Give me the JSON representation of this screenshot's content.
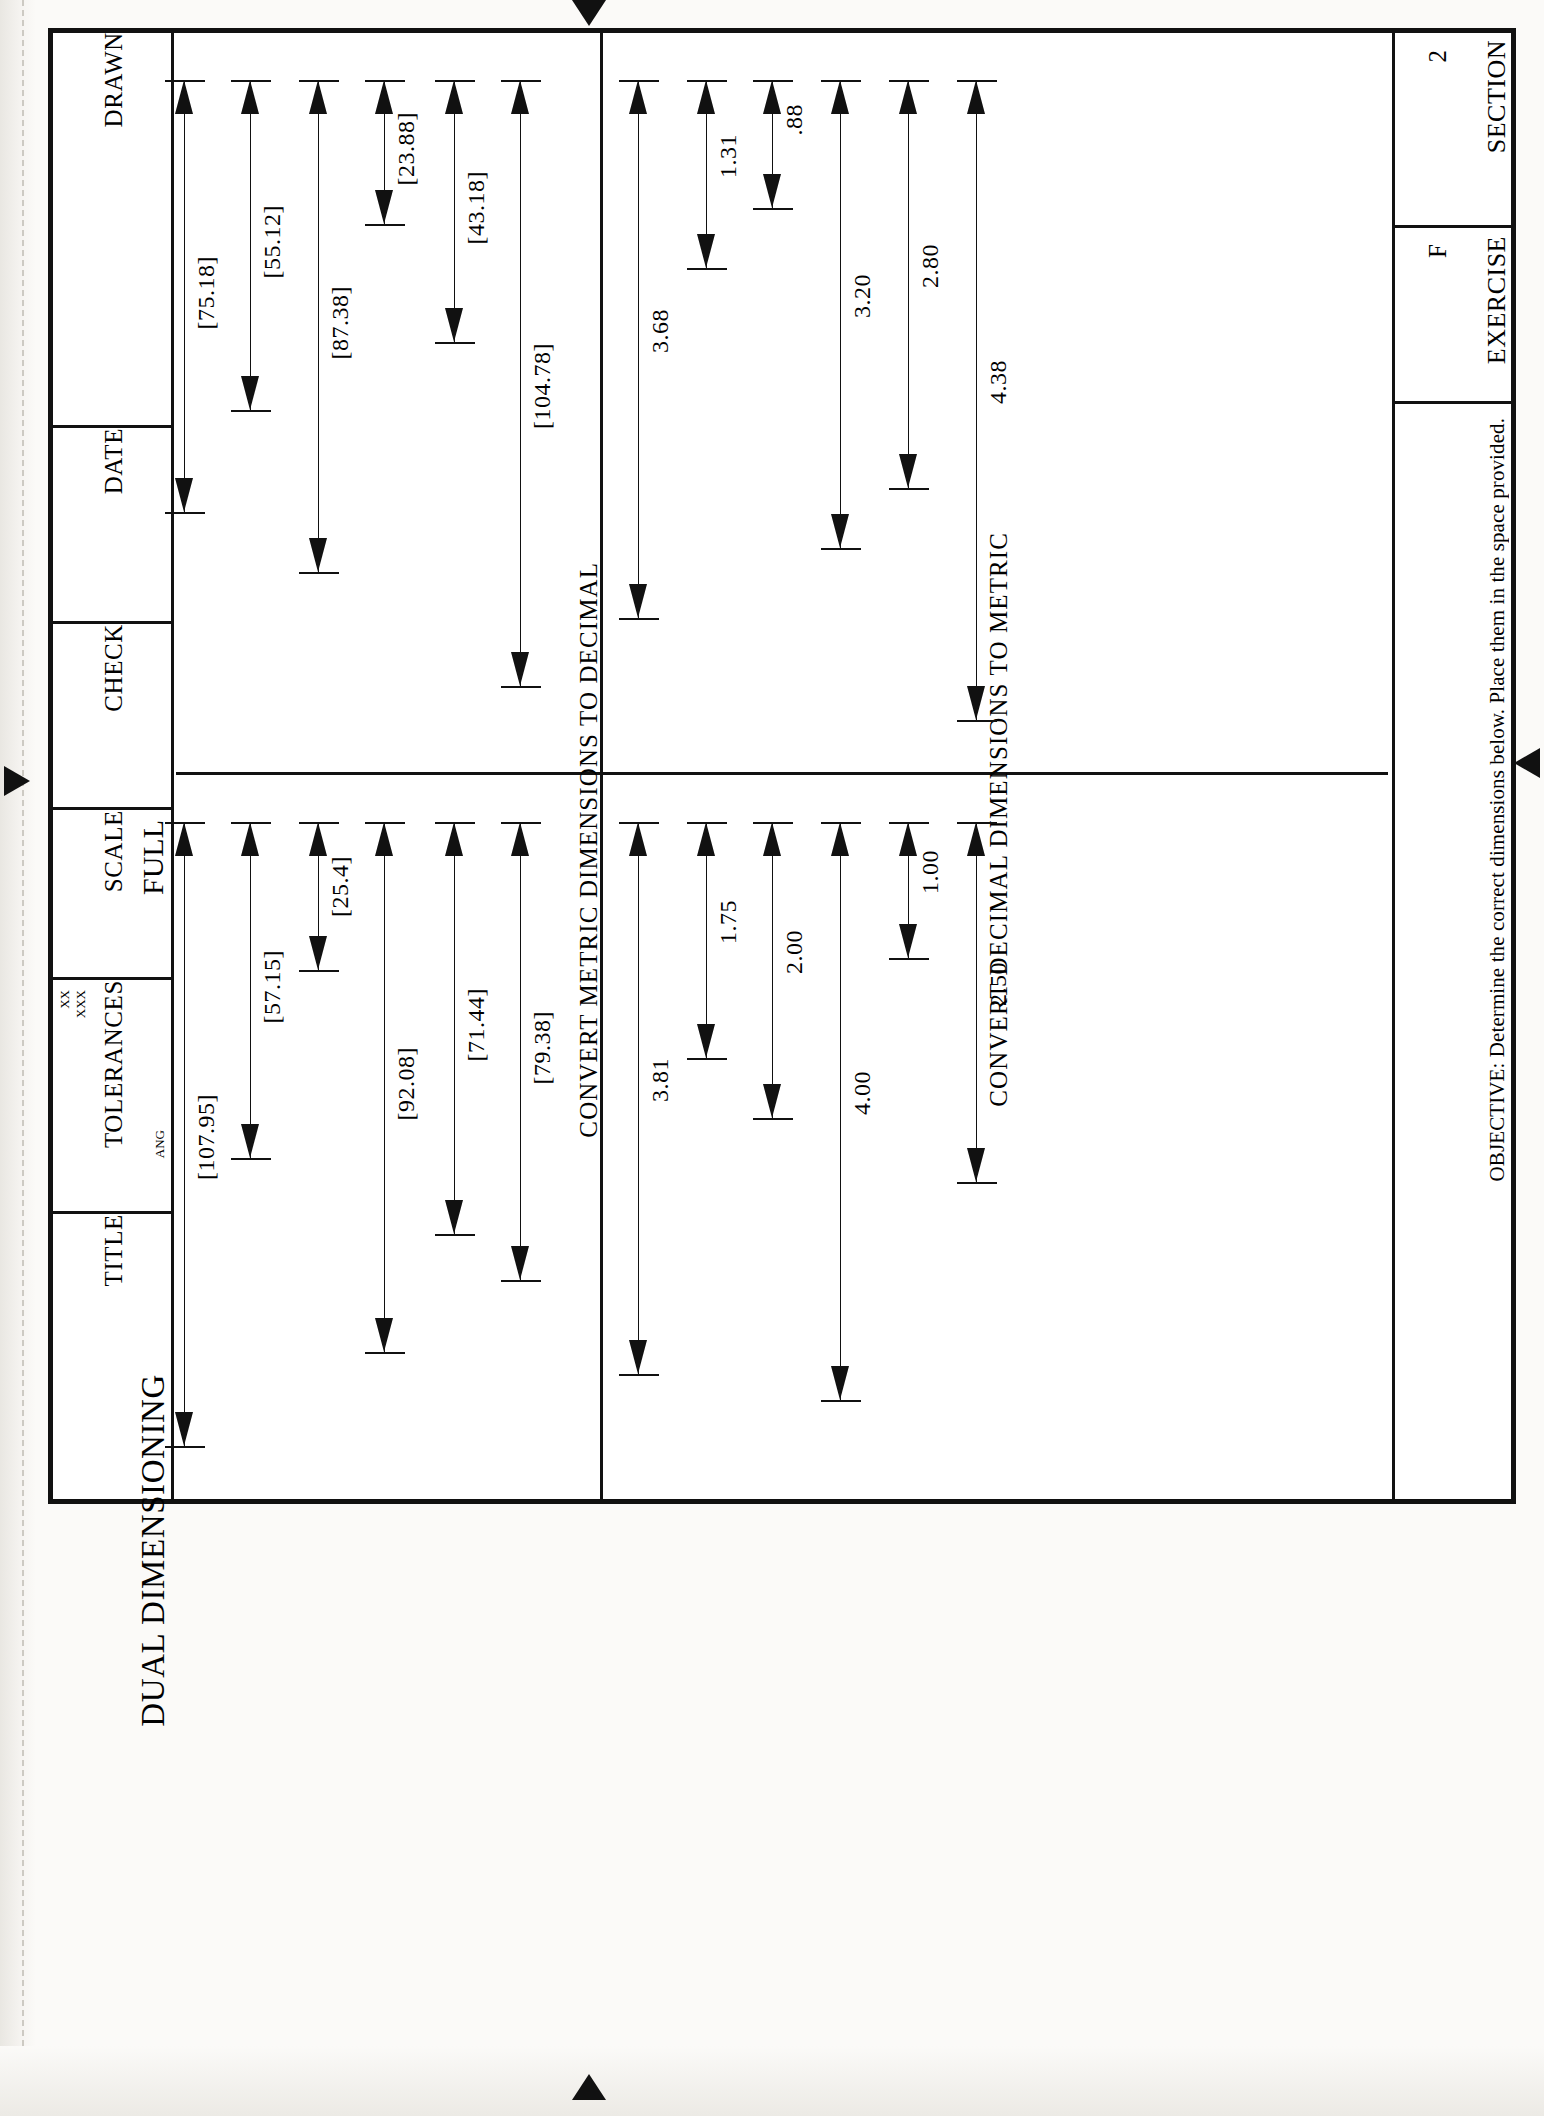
{
  "sheet": {
    "title_block": {
      "fields": [
        {
          "label": "DRAWN",
          "value": ""
        },
        {
          "label": "DATE",
          "value": ""
        },
        {
          "label": "CHECK",
          "value": ""
        },
        {
          "label": "SCALE",
          "value": "FULL"
        },
        {
          "label": "TOLERANCES",
          "value": "",
          "tol_xx": "XX",
          "tol_xxx": "XXX",
          "tol_ang": "ANG"
        },
        {
          "label": "TITLE",
          "value": "DUAL DIMENSIONING"
        }
      ]
    },
    "header": {
      "section_label": "SECTION",
      "section_value": "2",
      "exercise_label": "EXERCISE",
      "exercise_value": "F",
      "objective": "OBJECTIVE: Determine the correct dimensions below. Place them in the space provided."
    },
    "headings": {
      "decimal_to_metric": "CONVERT DECIMAL DIMENSIONS TO METRIC",
      "metric_to_decimal": "CONVERT METRIC DIMENSIONS TO DECIMAL"
    }
  },
  "chart_data": {
    "type": "table",
    "title": "DUAL DIMENSIONING",
    "xlabel": "",
    "ylabel": "",
    "quadrants": [
      {
        "name": "decimal-to-metric-given",
        "heading": "CONVERT DECIMAL DIMENSIONS TO METRIC",
        "units": "inch",
        "dimensions": [
          {
            "label": ".88",
            "value": 0.88
          },
          {
            "label": "1.31",
            "value": 1.31
          },
          {
            "label": "3.68",
            "value": 3.68
          },
          {
            "label": "3.20",
            "value": 3.2
          },
          {
            "label": "2.80",
            "value": 2.8
          },
          {
            "label": "4.38",
            "value": 4.38
          }
        ]
      },
      {
        "name": "decimal-to-metric-answers",
        "heading": "",
        "units": "mm",
        "dimensions": [
          {
            "label": "[23.88]",
            "value": 23.88
          },
          {
            "label": "[43.18]",
            "value": 43.18
          },
          {
            "label": "[104.78]",
            "value": 104.78
          },
          {
            "label": "[87.38]",
            "value": 87.38
          },
          {
            "label": "[55.12]",
            "value": 55.12
          },
          {
            "label": "[75.18]",
            "value": 75.18
          }
        ]
      },
      {
        "name": "metric-to-decimal-given",
        "heading": "CONVERT METRIC DIMENSIONS TO DECIMAL",
        "units": "inch",
        "dimensions": [
          {
            "label": "1.00",
            "value": 1.0
          },
          {
            "label": "2.00",
            "value": 2.0
          },
          {
            "label": "1.75",
            "value": 1.75
          },
          {
            "label": "3.81",
            "value": 3.81
          },
          {
            "label": "4.00",
            "value": 4.0
          },
          {
            "label": "2.50",
            "value": 2.5
          }
        ]
      },
      {
        "name": "metric-to-decimal-answers",
        "heading": "",
        "units": "mm",
        "dimensions": [
          {
            "label": "[25.4]",
            "value": 25.4
          },
          {
            "label": "[57.15]",
            "value": 57.15
          },
          {
            "label": "[92.08]",
            "value": 92.08
          },
          {
            "label": "[71.44]",
            "value": 71.44
          },
          {
            "label": "[79.38]",
            "value": 79.38
          },
          {
            "label": "[107.95]",
            "value": 107.95
          }
        ]
      }
    ]
  },
  "dims": {
    "q1": [
      {
        "label": "[75.18]",
        "x": 8,
        "y": 48,
        "len": 432
      },
      {
        "label": "[55.12]",
        "x": 74,
        "y": 48,
        "len": 330
      },
      {
        "label": "[87.38]",
        "x": 142,
        "y": 48,
        "len": 492
      },
      {
        "label": "[23.88]",
        "x": 208,
        "y": 48,
        "len": 144
      },
      {
        "label": "[43.18]",
        "x": 278,
        "y": 48,
        "len": 262
      },
      {
        "label": "[104.78]",
        "x": 344,
        "y": 48,
        "len": 606
      }
    ],
    "q2": [
      {
        "label": "3.68",
        "x": 462,
        "y": 48,
        "len": 538
      },
      {
        "label": "1.31",
        "x": 530,
        "y": 48,
        "len": 188
      },
      {
        "label": ".88",
        "x": 596,
        "y": 48,
        "len": 128
      },
      {
        "label": "3.20",
        "x": 664,
        "y": 48,
        "len": 468
      },
      {
        "label": "2.80",
        "x": 732,
        "y": 48,
        "len": 408
      },
      {
        "label": "4.38",
        "x": 800,
        "y": 48,
        "len": 640
      }
    ],
    "q3": [
      {
        "label": "[107.95]",
        "x": 8,
        "y": 790,
        "len": 624
      },
      {
        "label": "[57.15]",
        "x": 74,
        "y": 790,
        "len": 336
      },
      {
        "label": "[25.4]",
        "x": 142,
        "y": 790,
        "len": 148
      },
      {
        "label": "[92.08]",
        "x": 208,
        "y": 790,
        "len": 530
      },
      {
        "label": "[71.44]",
        "x": 278,
        "y": 790,
        "len": 412
      },
      {
        "label": "[79.38]",
        "x": 344,
        "y": 790,
        "len": 458
      }
    ],
    "q4": [
      {
        "label": "3.81",
        "x": 462,
        "y": 790,
        "len": 552
      },
      {
        "label": "1.75",
        "x": 530,
        "y": 790,
        "len": 236
      },
      {
        "label": "2.00",
        "x": 596,
        "y": 790,
        "len": 296
      },
      {
        "label": "4.00",
        "x": 664,
        "y": 790,
        "len": 578
      },
      {
        "label": "1.00",
        "x": 732,
        "y": 790,
        "len": 136
      },
      {
        "label": "2.50",
        "x": 800,
        "y": 790,
        "len": 360
      }
    ]
  }
}
